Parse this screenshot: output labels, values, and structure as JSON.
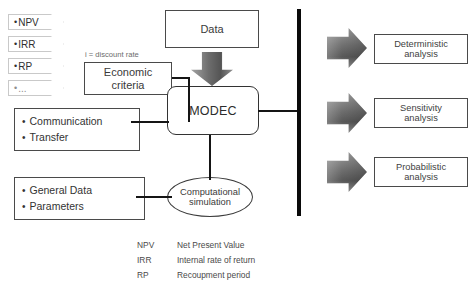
{
  "diagram": {
    "left_tags": [
      {
        "name": "tag-npv",
        "bullet": "•",
        "label": "NPV"
      },
      {
        "name": "tag-irr",
        "bullet": "•",
        "label": "IRR"
      },
      {
        "name": "tag-rp",
        "bullet": "•",
        "label": "RP"
      },
      {
        "name": "tag-more",
        "bullet": "•",
        "label": "..."
      }
    ],
    "nodes": {
      "data": {
        "label": "Data",
        "shape": "rectangle"
      },
      "economic_criteria": {
        "line1": "Economic",
        "line2": "criteria",
        "shape": "rectangle"
      },
      "economic_criteria_note": "i = discount rate",
      "modec": {
        "label": "MODEC",
        "shape": "rounded-rectangle"
      },
      "communication_transfer": {
        "shape": "rectangle",
        "items": [
          "Communication",
          "Transfer"
        ]
      },
      "general_data_parameters": {
        "shape": "rectangle",
        "items": [
          "General Data",
          "Parameters"
        ]
      },
      "computational_simulation": {
        "line1": "Computational",
        "line2": "simulation",
        "shape": "ellipse"
      }
    },
    "outputs": [
      {
        "name": "deterministic",
        "line1": "Deterministic",
        "line2": "analysis"
      },
      {
        "name": "sensitivity",
        "line1": "Sensitivity",
        "line2": "analysis"
      },
      {
        "name": "probabilistic",
        "line1": "Probabilistic",
        "line2": "analysis"
      }
    ],
    "legend": [
      {
        "abbr": "NPV",
        "desc": "Net Present Value"
      },
      {
        "abbr": "IRR",
        "desc": "Internal rate of return"
      },
      {
        "abbr": "RP",
        "desc": "Recoupment period"
      }
    ],
    "colors": {
      "background": "#ffffff",
      "box_border": "#4a4a4a",
      "bus_bar": "#0a0a0a",
      "arrow_gray_light": "#a4a4a4",
      "arrow_gray_dark": "#555555",
      "text": "#3a3a3a",
      "tag_border": "#c9c9c9"
    }
  }
}
